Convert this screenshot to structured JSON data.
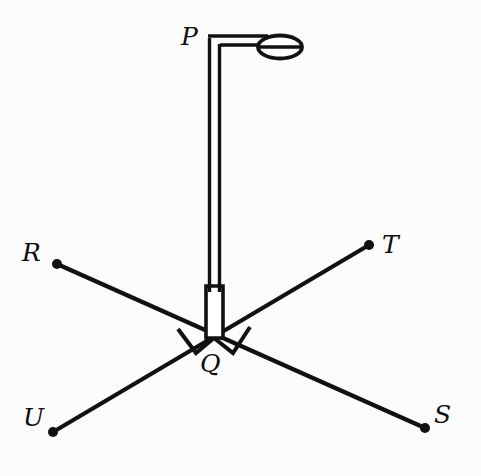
{
  "figure": {
    "type": "geometry-diagram",
    "background_color": "#fcfcfc",
    "stroke_color": "#111111",
    "canvas": {
      "width": 481,
      "height": 476
    }
  },
  "labels": {
    "P": {
      "text": "P",
      "x": 181,
      "y": 24
    },
    "R": {
      "text": "R",
      "x": 22,
      "y": 240
    },
    "T": {
      "text": "T",
      "x": 382,
      "y": 232
    },
    "Q": {
      "text": "Q",
      "x": 200,
      "y": 351
    },
    "U": {
      "text": "U",
      "x": 23,
      "y": 405
    },
    "S": {
      "text": "S",
      "x": 434,
      "y": 402
    }
  },
  "points": {
    "Q": {
      "x": 214,
      "y": 338
    },
    "P_top": {
      "x": 214,
      "y": 38
    },
    "R": {
      "x": 57,
      "y": 264
    },
    "T": {
      "x": 369,
      "y": 245
    },
    "U": {
      "x": 53,
      "y": 432
    },
    "S": {
      "x": 425,
      "y": 428
    }
  },
  "segments": [
    {
      "name": "segment-RS",
      "from": "R",
      "to": "S"
    },
    {
      "name": "segment-UT",
      "from": "U",
      "to": "T"
    },
    {
      "name": "segment-PQ",
      "from": "P_top",
      "to": "Q"
    }
  ],
  "right_angle_marks": [
    {
      "name": "right-angle-left",
      "between": "QR and QP"
    },
    {
      "name": "right-angle-right",
      "between": "QP and QT"
    }
  ],
  "lamp": {
    "name": "street-lamp",
    "pole_top_y": 38,
    "arm_end_x": 268,
    "head_center": {
      "x": 280,
      "y": 48
    },
    "head_rx": 21,
    "head_ry": 11
  }
}
